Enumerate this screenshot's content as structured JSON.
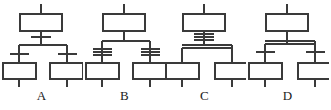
{
  "figure": {
    "kind": "sfc-divergence-comparison",
    "width": 331,
    "height": 110,
    "background_color": "#ffffff",
    "stroke_color": "#3a3a3a",
    "label_color": "#1a1a1a"
  },
  "diagrams": [
    {
      "id": "A",
      "label": "A",
      "divergence_type": "single-line",
      "transition_above_split": true,
      "transitions_below_split": [
        "left",
        "right"
      ],
      "step_boxes": 3,
      "branches": 2
    },
    {
      "id": "B",
      "label": "B",
      "divergence_type": "single-line",
      "transition_above_split": false,
      "transitions_below_split": [
        "left",
        "right"
      ],
      "step_boxes": 3,
      "branches": 2
    },
    {
      "id": "C",
      "label": "C",
      "divergence_type": "double-line",
      "transition_above_split": true,
      "transitions_below_split": [],
      "step_boxes": 3,
      "branches": 2
    },
    {
      "id": "D",
      "label": "D",
      "divergence_type": "double-line",
      "transition_above_split": false,
      "transitions_below_split": [
        "left",
        "right"
      ],
      "step_boxes": 3,
      "branches": 2
    }
  ]
}
